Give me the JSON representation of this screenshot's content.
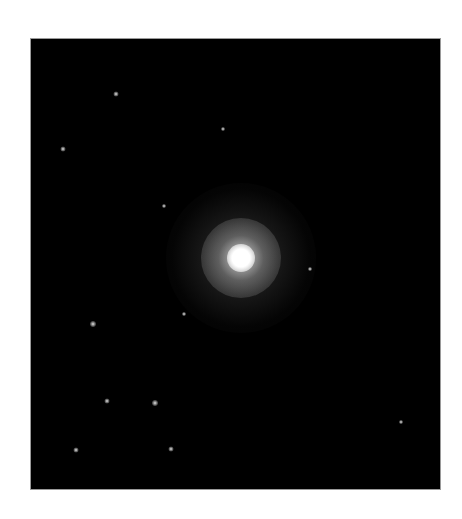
{
  "image": {
    "subject": "Bright star with diffuse halo against black star field",
    "background_color": "#000000",
    "page_background": "#ffffff",
    "frame": {
      "x": 30,
      "y": 38,
      "width": 411,
      "height": 452
    },
    "central_star": {
      "cx": 240,
      "cy": 257,
      "color": "#ffffff"
    },
    "field_stars": [
      {
        "x": 115,
        "y": 93,
        "size": 3
      },
      {
        "x": 62,
        "y": 148,
        "size": 3
      },
      {
        "x": 222,
        "y": 128,
        "size": 2
      },
      {
        "x": 163,
        "y": 205,
        "size": 2
      },
      {
        "x": 92,
        "y": 323,
        "size": 4
      },
      {
        "x": 183,
        "y": 313,
        "size": 2
      },
      {
        "x": 154,
        "y": 402,
        "size": 4
      },
      {
        "x": 106,
        "y": 400,
        "size": 3
      },
      {
        "x": 75,
        "y": 449,
        "size": 3
      },
      {
        "x": 170,
        "y": 448,
        "size": 3
      },
      {
        "x": 309,
        "y": 268,
        "size": 2
      },
      {
        "x": 400,
        "y": 421,
        "size": 2
      }
    ]
  }
}
